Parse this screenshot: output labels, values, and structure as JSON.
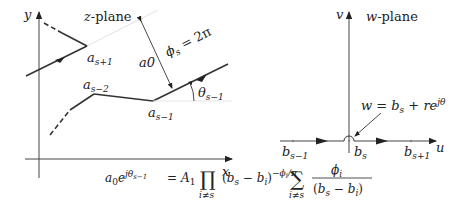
{
  "z_plane": {
    "title_var": "z",
    "title_rest": "-plane",
    "y_axis_label": "y",
    "x_axis_label": "x",
    "vertex_as_plus1": {
      "base": "a",
      "sub": "s+1"
    },
    "vertex_as_minus2": {
      "base": "a",
      "sub": "s−2"
    },
    "vertex_as_minus1": {
      "base": "a",
      "sub": "s−1"
    },
    "distance_label": "a0",
    "angle_label": {
      "base": "θ",
      "sub": "s−1"
    },
    "phi_label": {
      "base": "ϕ",
      "sub": "s",
      "rest": " = 2π"
    }
  },
  "w_plane": {
    "title_var": "w",
    "title_rest": "-plane",
    "v_axis_label": "v",
    "u_axis_label": "u",
    "point_b_minus1": {
      "base": "b",
      "sub": "s−1"
    },
    "point_b_s": {
      "base": "b",
      "sub": "s"
    },
    "point_b_plus1": {
      "base": "b",
      "sub": "s+1"
    },
    "indent_label": {
      "lhs": "w = b",
      "sub": "s",
      "rhs": " + re",
      "sup": "jθ"
    }
  },
  "equation": {
    "lhs_base": "a",
    "lhs_sub": "0",
    "lhs_e": "e",
    "lhs_sup": "jθ",
    "lhs_sup_sub": "s−1",
    "equals": "=",
    "A": "A",
    "A_sub": "1",
    "prod": "∏",
    "prod_sub": "i≠s",
    "paren": "(b",
    "paren_sub1": "s",
    "paren_mid": " − b",
    "paren_sub2": "i",
    "paren_close": ")",
    "exp": "−ϕ",
    "exp_sub": "i",
    "exp_rest": "/π",
    "sum": "∑",
    "sum_sub": "i≠s",
    "frac_num": "ϕ",
    "frac_num_sub": "i",
    "frac_den": "(b",
    "frac_den_sub1": "s",
    "frac_den_mid": " − b",
    "frac_den_sub2": "i",
    "frac_den_close": ")"
  },
  "colors": {
    "line": "#333333",
    "axis": "#444444",
    "faint": "#dddddd"
  }
}
